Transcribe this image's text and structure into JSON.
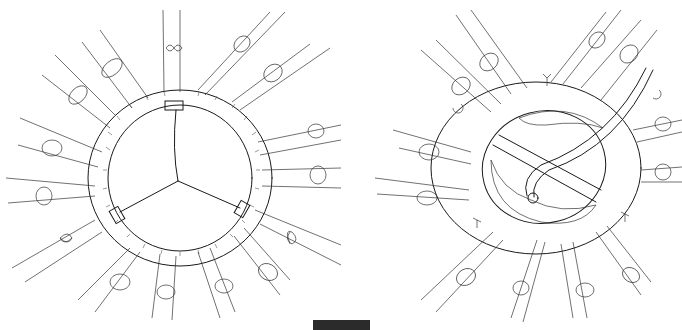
{
  "figure": {
    "panels": [
      {
        "id": "left",
        "label": "Valve sewing ring with trileaflet coaptation lines and three commissure posts",
        "suture_count": 18,
        "commissure_posts": 3,
        "figure_eight_marks": 3
      },
      {
        "id": "right",
        "label": "Prosthesis seated in annulus with instrument retracting leaflet; hatched tissue",
        "suture_count": 18,
        "c_marks": 2
      }
    ],
    "scale_bar": {
      "color": "#2b2b2b"
    }
  },
  "colors": {
    "ink": "#1a1a1a",
    "background": "#ffffff"
  }
}
